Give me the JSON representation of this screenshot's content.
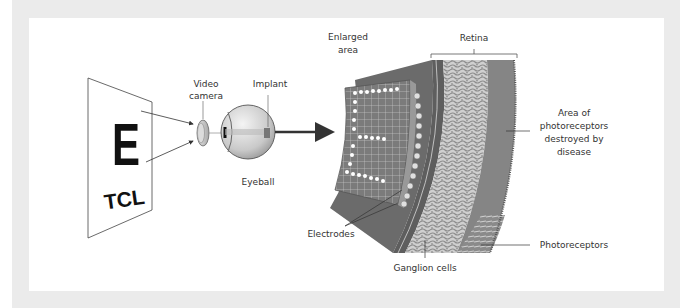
{
  "diagram": {
    "chart": {
      "letter_large": "E",
      "letters_small": "TCL"
    },
    "labels": {
      "video_camera": [
        "Video",
        "camera"
      ],
      "implant": "Implant",
      "eyeball": "Eyeball",
      "enlarged_area": [
        "Enlarged",
        "area"
      ],
      "retina": "Retina",
      "area_destroyed": [
        "Area of",
        "photoreceptors",
        "destroyed by",
        "disease"
      ],
      "electrodes": "Electrodes",
      "ganglion_cells": "Ganglion cells",
      "photoreceptors": "Photoreceptors"
    },
    "colors": {
      "frame": "#ebebeb",
      "panel": "#ffffff",
      "dark_layer": "#6e6e6e",
      "mid_layer": "#8a8a8a",
      "ganglion_light": "#d6d6d6",
      "electrode_array": "#7d7d7d",
      "text": "#333333"
    }
  }
}
